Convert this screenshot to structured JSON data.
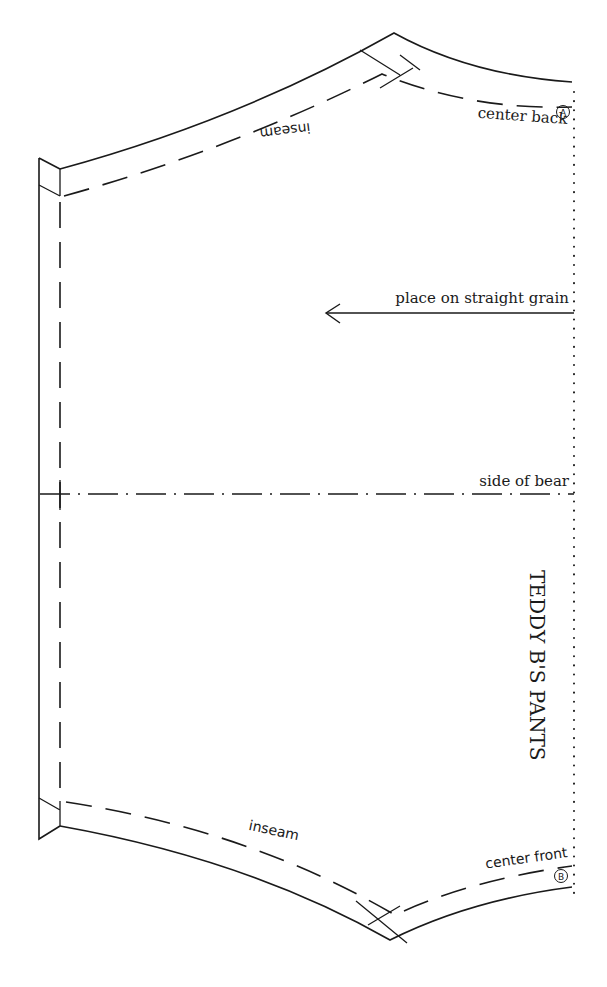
{
  "pattern": {
    "title": "TEDDY B'S PANTS",
    "labels": {
      "center_back": "center back",
      "center_front": "center front",
      "inseam_top": "inseam",
      "inseam_bottom": "inseam",
      "grain": "place on straight grain",
      "side": "side of bear"
    },
    "markers": {
      "top": "A",
      "bottom": "B"
    },
    "icons": {
      "grain_arrow": "arrow-left",
      "fold_line": "dotted-line",
      "notch_a": "circled-letter-a",
      "notch_b": "circled-letter-b"
    },
    "colors": {
      "ink": "#1a1a1a",
      "paper": "#ffffff"
    }
  }
}
